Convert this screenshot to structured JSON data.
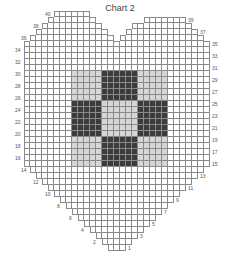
{
  "title": "Chart 2",
  "colors": {
    "empty": "#ffffff",
    "light": "#d6d6d6",
    "dark": "#3c3c3c",
    "gridline": "#8a8a8a"
  },
  "grid": {
    "cell_px": 6,
    "origin_x": 24,
    "bottom_y": 251,
    "columns": 31,
    "rows": 40
  },
  "row_spans": {
    "1": [
      [
        14,
        16
      ]
    ],
    "2": [
      [
        13,
        17
      ]
    ],
    "3": [
      [
        12,
        18
      ]
    ],
    "4": [
      [
        11,
        19
      ]
    ],
    "5": [
      [
        10,
        20
      ]
    ],
    "6": [
      [
        9,
        21
      ]
    ],
    "7": [
      [
        8,
        22
      ]
    ],
    "8": [
      [
        7,
        23
      ]
    ],
    "9": [
      [
        6,
        24
      ]
    ],
    "10": [
      [
        5,
        25
      ]
    ],
    "11": [
      [
        4,
        26
      ]
    ],
    "12": [
      [
        3,
        27
      ]
    ],
    "13": [
      [
        2,
        28
      ]
    ],
    "14": [
      [
        1,
        29
      ]
    ],
    "15": [
      [
        0,
        30
      ]
    ],
    "16": [
      [
        0,
        30
      ]
    ],
    "17": [
      [
        0,
        30
      ]
    ],
    "18": [
      [
        0,
        30
      ]
    ],
    "19": [
      [
        0,
        30
      ]
    ],
    "20": [
      [
        0,
        30
      ]
    ],
    "21": [
      [
        0,
        30
      ]
    ],
    "22": [
      [
        0,
        30
      ]
    ],
    "23": [
      [
        0,
        30
      ]
    ],
    "24": [
      [
        0,
        30
      ]
    ],
    "25": [
      [
        0,
        30
      ]
    ],
    "26": [
      [
        0,
        30
      ]
    ],
    "27": [
      [
        0,
        30
      ]
    ],
    "28": [
      [
        0,
        30
      ]
    ],
    "29": [
      [
        0,
        30
      ]
    ],
    "30": [
      [
        0,
        30
      ]
    ],
    "31": [
      [
        0,
        30
      ]
    ],
    "32": [
      [
        0,
        30
      ]
    ],
    "33": [
      [
        0,
        30
      ]
    ],
    "34": [
      [
        0,
        30
      ]
    ],
    "35": [
      [
        0,
        30
      ]
    ],
    "36": [
      [
        1,
        14
      ],
      [
        16,
        29
      ]
    ],
    "37": [
      [
        2,
        13
      ],
      [
        17,
        28
      ]
    ],
    "38": [
      [
        3,
        12
      ],
      [
        18,
        27
      ]
    ],
    "39": [
      [
        4,
        11
      ],
      [
        20,
        26
      ]
    ],
    "40": [
      [
        5,
        10
      ]
    ]
  },
  "fills": [
    {
      "color": "light",
      "cols": [
        8,
        23
      ],
      "rows": [
        15,
        30
      ]
    },
    {
      "color": "dark",
      "cols": [
        13,
        18
      ],
      "rows": [
        26,
        30
      ]
    },
    {
      "color": "dark",
      "cols": [
        8,
        12
      ],
      "rows": [
        20,
        25
      ]
    },
    {
      "color": "dark",
      "cols": [
        19,
        23
      ],
      "rows": [
        20,
        25
      ]
    },
    {
      "color": "dark",
      "cols": [
        13,
        18
      ],
      "rows": [
        15,
        19
      ]
    }
  ],
  "row_labels": {
    "left": [
      2,
      4,
      6,
      8,
      10,
      12,
      14,
      16,
      18,
      20,
      22,
      24,
      26,
      28,
      30,
      32,
      34,
      36,
      38,
      40
    ],
    "right": [
      1,
      3,
      5,
      7,
      9,
      11,
      13,
      15,
      17,
      19,
      21,
      23,
      25,
      27,
      29,
      31,
      33,
      35,
      37,
      39
    ]
  }
}
